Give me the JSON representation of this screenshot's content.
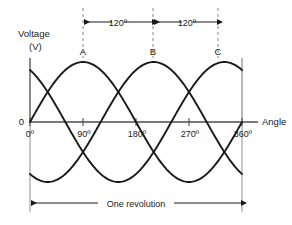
{
  "figure": {
    "y_axis_label_line1": "Voltage",
    "y_axis_label_line2": "(V)",
    "x_axis_label": "Angle",
    "origin_label": "0"
  },
  "peak_labels": [
    {
      "name": "A",
      "text": "A",
      "angle_deg": 90
    },
    {
      "name": "B",
      "text": "B",
      "angle_deg": 210
    },
    {
      "name": "C",
      "text": "C",
      "angle_deg": 330
    }
  ],
  "dimensions": {
    "phase_separation_1": "120º",
    "phase_separation_2": "120º",
    "revolution_label": "One revolution"
  },
  "colors": {
    "curve": "#1a1a1a",
    "axis": "#4d4d4d",
    "dashed_guide": "#808080",
    "text": "#1a1a1a",
    "background": "#ffffff"
  },
  "chart_data": {
    "type": "line",
    "title": "",
    "xlabel": "Angle",
    "ylabel": "Voltage (V)",
    "xlim": [
      0,
      360
    ],
    "ylim": [
      -1,
      1
    ],
    "grid": false,
    "legend": "none",
    "x_tick_labels": [
      "0º",
      "90º",
      "180º",
      "270º",
      "360º"
    ],
    "x_ticks": [
      0,
      90,
      180,
      270,
      360
    ],
    "y_tick_labels": [
      "0"
    ],
    "y_ticks": [
      0
    ],
    "annotations": [
      {
        "text": "A",
        "x": 90,
        "y": 1
      },
      {
        "text": "B",
        "x": 210,
        "y": 1
      },
      {
        "text": "C",
        "x": 330,
        "y": 1
      },
      {
        "text": "120º",
        "from_x": 90,
        "to_x": 210
      },
      {
        "text": "120º",
        "from_x": 210,
        "to_x": 330
      },
      {
        "text": "One revolution",
        "from_x": 0,
        "to_x": 360
      }
    ],
    "series": [
      {
        "name": "Phase A",
        "phase_deg": 0,
        "amplitude": 1,
        "formula": "sin(x)"
      },
      {
        "name": "Phase B",
        "phase_deg": -120,
        "amplitude": 1,
        "formula": "sin(x - 120)"
      },
      {
        "name": "Phase C",
        "phase_deg": -240,
        "amplitude": 1,
        "formula": "sin(x - 240)"
      }
    ],
    "x": [
      0,
      15,
      30,
      45,
      60,
      75,
      90,
      105,
      120,
      135,
      150,
      165,
      180,
      195,
      210,
      225,
      240,
      255,
      270,
      285,
      300,
      315,
      330,
      345,
      360
    ],
    "values_phase_a": [
      0,
      0.259,
      0.5,
      0.707,
      0.866,
      0.966,
      1,
      0.966,
      0.866,
      0.707,
      0.5,
      0.259,
      0,
      -0.259,
      -0.5,
      -0.707,
      -0.866,
      -0.966,
      -1,
      -0.966,
      -0.866,
      -0.707,
      -0.5,
      -0.259,
      0
    ],
    "values_phase_b": [
      -0.866,
      -0.966,
      -1,
      -0.966,
      -0.866,
      -0.707,
      -0.5,
      -0.259,
      0,
      0.259,
      0.5,
      0.707,
      0.866,
      0.966,
      1,
      0.966,
      0.866,
      0.707,
      0.5,
      0.259,
      0,
      -0.259,
      -0.5,
      -0.707,
      -0.866
    ],
    "values_phase_c": [
      0.866,
      0.707,
      0.5,
      0.259,
      0,
      -0.259,
      -0.5,
      -0.707,
      -0.866,
      -0.966,
      -1,
      -0.966,
      -0.866,
      -0.707,
      -0.5,
      -0.259,
      0,
      0.259,
      0.5,
      0.707,
      0.866,
      0.966,
      1,
      0.966,
      0.866
    ]
  }
}
